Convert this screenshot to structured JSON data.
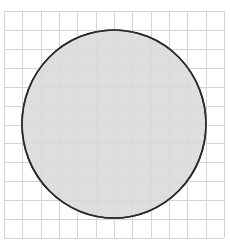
{
  "figure": {
    "grid": {
      "columns": 12,
      "rows": 12,
      "line_color": "#d4d4d4"
    },
    "shape": {
      "type": "circle",
      "fill_color": "#dedede",
      "stroke_color": "#2a2a2a",
      "center_cell": [
        6,
        6
      ],
      "radius_cells": 5
    }
  }
}
